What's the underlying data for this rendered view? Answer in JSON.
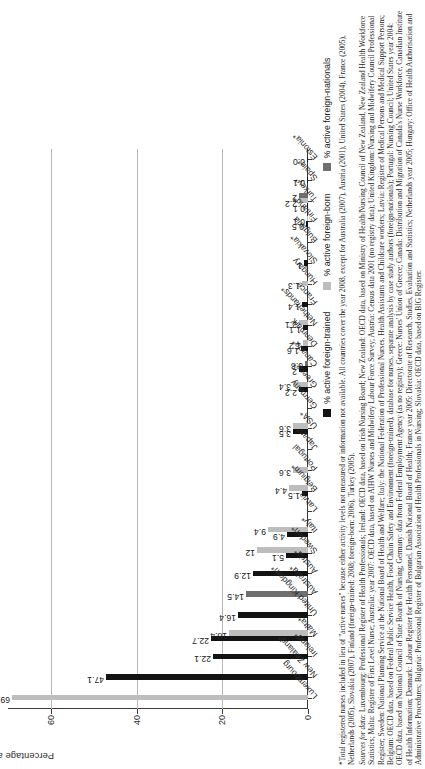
{
  "chart_data": {
    "type": "bar",
    "title": "",
    "xlabel": "",
    "ylabel": "Percentage active nurses among all active nurses",
    "ylim": [
      0,
      70
    ],
    "yticks": [
      0,
      20,
      40,
      60
    ],
    "ytick_labels": [
      "0",
      "20",
      "40",
      "60"
    ],
    "grid": true,
    "legend_position": "bottom-right",
    "categories": [
      "Luxembourg",
      "New Zealand*",
      "Ireland*",
      "Malta*",
      "United Kingdom*",
      "Australia*",
      "Austria*",
      "Sweden*",
      "Italy*",
      "Latvia",
      "Belgium*",
      "Portugal",
      "Japan*",
      "USA*",
      "Germany",
      "Greece*",
      "Canada*",
      "Denmark",
      "Netherlands*",
      "France",
      "Hungary",
      "Slovakia*",
      "Bulgaria",
      "Finland*",
      "Turkey*",
      "Spain*",
      "Estonia*"
    ],
    "series": [
      {
        "name": "% active foreign-trained",
        "color": "#131313",
        "values": [
          null,
          47.1,
          22.1,
          22.7,
          16.4,
          null,
          12.9,
          5.1,
          4.9,
          null,
          1.5,
          null,
          null,
          3.5,
          null,
          2.2,
          2.0,
          1.6,
          1.1,
          1.4,
          null,
          1.0,
          null,
          0.5,
          0.1,
          0.1,
          0.0
        ]
      },
      {
        "name": "% active foreign-born",
        "color": "#bdbdbd",
        "values": [
          69.1,
          null,
          null,
          18.4,
          null,
          null,
          null,
          12.0,
          9.4,
          null,
          4.4,
          3.6,
          null,
          3.6,
          null,
          3.4,
          null,
          1.2,
          2.1,
          null,
          1.3,
          null,
          null,
          0.1,
          2.2,
          null,
          null
        ]
      },
      {
        "name": "% active foreign-nationals",
        "color": "#6f6f6f",
        "values": [
          null,
          null,
          null,
          null,
          null,
          14.5,
          null,
          null,
          null,
          null,
          null,
          null,
          null,
          null,
          null,
          null,
          0.8,
          null,
          null,
          null,
          null,
          null,
          null,
          null,
          2.0,
          null,
          null
        ]
      }
    ],
    "value_labels": [
      {
        "category": "Luxembourg",
        "text": "69.1"
      },
      {
        "category": "New Zealand*",
        "text": "47.1"
      },
      {
        "category": "Ireland*",
        "text": "22.1"
      },
      {
        "category": "Malta*",
        "text": "22.7"
      },
      {
        "category": "Malta*",
        "text": "18.4"
      },
      {
        "category": "United Kingdom*",
        "text": "16.4"
      },
      {
        "category": "Australia*",
        "text": "14.5"
      },
      {
        "category": "Austria*",
        "text": "12.9"
      },
      {
        "category": "Sweden*",
        "text": "12"
      },
      {
        "category": "Sweden*",
        "text": "5.1"
      },
      {
        "category": "Italy*",
        "text": "9.4"
      },
      {
        "category": "Italy*",
        "text": "4.9"
      },
      {
        "category": "Belgium*",
        "text": "4.4"
      },
      {
        "category": "Belgium*",
        "text": "1.5"
      },
      {
        "category": "Portugal",
        "text": "3.6"
      },
      {
        "category": "USA*",
        "text": "3.6"
      },
      {
        "category": "USA*",
        "text": "3.5"
      },
      {
        "category": "Greece*",
        "text": "3.4"
      },
      {
        "category": "Greece*",
        "text": "2.2"
      },
      {
        "category": "Canada*",
        "text": "0.8"
      },
      {
        "category": "Canada*",
        "text": "2"
      },
      {
        "category": "Denmark",
        "text": "1.6"
      },
      {
        "category": "Denmark",
        "text": "2.1"
      },
      {
        "category": "Netherlands*",
        "text": "1.6"
      },
      {
        "category": "France",
        "text": "1.4"
      },
      {
        "category": "Slovakia*",
        "text": "1.3"
      },
      {
        "category": "Slovakia*",
        "text": "1"
      },
      {
        "category": "Bulgaria",
        "text": "1"
      },
      {
        "category": "Finland*",
        "text": "0.1"
      },
      {
        "category": "Finland*",
        "text": "0.5"
      },
      {
        "category": "Turkey*",
        "text": "2.2"
      },
      {
        "category": "Turkey*",
        "text": "0.1"
      },
      {
        "category": "Spain*",
        "text": "0.1"
      },
      {
        "category": "Estonia*",
        "text": "0.0"
      }
    ]
  },
  "axis": {
    "ylabel": "Percentage active nurses among all active nurses",
    "tick0": "0",
    "tick20": "20",
    "tick40": "40",
    "tick60": "60"
  },
  "legend": {
    "trained": "% active foreign-trained",
    "born": "% active foreign-born",
    "nationals": "% active foreign-nationals"
  },
  "notes": {
    "footnote": "*Total registered nurses included in lieu of \"active nurses\" because either activity levels not measured or information not available. All countries cover the year 2008, except for Australia (2007), Austria (2001), United States (2004), France (2005), Netherlands (2005), Slovakia (2007), Finland (foreign-trained: 2008; foreign-born: 2006), Turkey (2005).",
    "sources_label": "Sources for data:",
    "sources": "Luxembourg: Professional Register of Health Professionals; Ireland: OECD data, based on Irish Nursing Board; New Zealand: OECD data, based on Ministry of Health/Nursing Council of New Zealand, New Zealand Health Workforce Statistics; Malta: Register of First Level Nurse; Australia: year 2007: OECD data, based on AIHW Nurses and Midwifery Labour Force Survey; Austria: Census data 2001 (no registry data); United Kingdom: Nursing and Midwifery Council Professional Register; Sweden: National Planning Service at the National Board of Health and Welfare; Italy: the National Federation of Professional Nurses, Health Assistants and Childcare workers; Latvia: Register of Medical Persons and Medical Support Persons; Belgium: OECD data, based on Federal Public Service Health, Food Chain Safety and Environment (foreign-trained), database for nurses, separate analysis by case study authors (foreign-nationals); Portugal: Nursing Council; United States year 2004: OECD data, based on National Council of State Boards of Nursing; Germany: data from Federal Employment Agency (as no registry); Greece: Nurses' Union of Greece; Canada: Distribution and Migration of Canada's Nurse Workforce, Canadian Institute of Health Information; Denmark: Labour Register for Health Personnel, Danish National Board of Health; France year 2005: Directorate of Research, Studies, Evaluation and Statistics; Netherlands year 2005; Hungary: Office of Health Authorisation and Administrative Procedures; Bulgaria: Professional Register of Bulgarian Association of Health Professionals in Nursing; Slovakia: OECD data, based on BIG Register."
  }
}
